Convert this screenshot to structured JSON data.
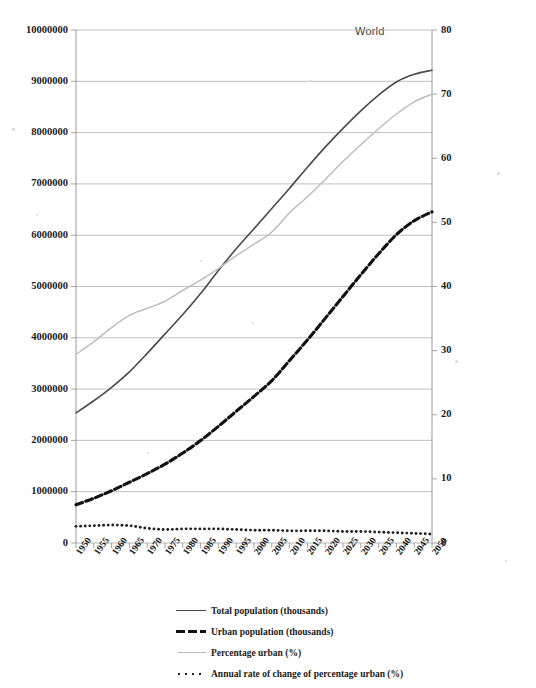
{
  "chart_data": {
    "type": "line",
    "title": "World",
    "xlabel": "",
    "ylabel": "",
    "y2label": "",
    "grid": true,
    "legend_position": "bottom",
    "xlim": [
      1950,
      2050
    ],
    "ylim": [
      0,
      10000000
    ],
    "y2lim": [
      0,
      80
    ],
    "x": [
      1950,
      1955,
      1960,
      1965,
      1970,
      1975,
      1980,
      1985,
      1990,
      1995,
      2000,
      2005,
      2010,
      2015,
      2020,
      2025,
      2030,
      2035,
      2040,
      2045,
      2050
    ],
    "xtick_labels": [
      "1950",
      "1955",
      "1960",
      "1965",
      "1970",
      "1975",
      "1980",
      "1985",
      "1990",
      "1995",
      "2000",
      "2005",
      "2010",
      "2015",
      "2020",
      "2025",
      "2030",
      "2035",
      "2040",
      "2045",
      "2050"
    ],
    "ytick_labels_left": [
      "0",
      "1000000",
      "2000000",
      "3000000",
      "4000000",
      "5000000",
      "6000000",
      "7000000",
      "8000000",
      "9000000",
      "10000000"
    ],
    "ytick_labels_right": [
      "0",
      "10",
      "20",
      "30",
      "40",
      "50",
      "60",
      "70",
      "80"
    ],
    "series": [
      {
        "name": "Total population (thousands)",
        "axis": "left",
        "style": "solid",
        "color": "#4a4a4a",
        "values": [
          2536000,
          2773000,
          3035000,
          3335000,
          3696000,
          4076000,
          4453000,
          4863000,
          5310000,
          5735000,
          6127000,
          6520000,
          6916000,
          7325000,
          7717000,
          8083000,
          8425000,
          8731000,
          8986000,
          9136000,
          9216000
        ]
      },
      {
        "name": "Urban population (thousands)",
        "axis": "left",
        "style": "dashed",
        "color": "#111111",
        "values": [
          745000,
          872000,
          1019000,
          1184000,
          1352000,
          1538000,
          1754000,
          1996000,
          2275000,
          2567000,
          2857000,
          3164000,
          3559000,
          3957000,
          4379000,
          4806000,
          5230000,
          5637000,
          6010000,
          6283000,
          6456000
        ]
      },
      {
        "name": "Percentage urban (%)",
        "axis": "right",
        "style": "solid-light",
        "color": "#bdbdbd",
        "values": [
          29.4,
          31.4,
          33.6,
          35.5,
          36.6,
          37.7,
          39.4,
          41.0,
          42.8,
          44.8,
          46.6,
          48.5,
          51.5,
          54.0,
          56.7,
          59.5,
          62.1,
          64.6,
          66.9,
          68.8,
          70.0
        ]
      },
      {
        "name": "Annual rate of change of percentage urban (%)",
        "axis": "right",
        "style": "dotted",
        "color": "#222222",
        "values": [
          2.6,
          2.7,
          2.8,
          2.7,
          2.3,
          2.1,
          2.2,
          2.2,
          2.2,
          2.1,
          2.0,
          2.0,
          1.9,
          1.9,
          1.9,
          1.8,
          1.8,
          1.7,
          1.6,
          1.5,
          1.4
        ]
      }
    ]
  },
  "legend": {
    "items": [
      {
        "label": "Total population (thousands)"
      },
      {
        "label": "Urban population (thousands)"
      },
      {
        "label": "Percentage urban (%)"
      },
      {
        "label": "Annual rate of change of percentage urban (%)"
      }
    ]
  },
  "colors": {
    "total_population": "#4a4a4a",
    "urban_population": "#111111",
    "percentage_urban": "#bdbdbd",
    "rate_of_change": "#222222",
    "grid": "#b9b9b9",
    "axis": "#9a9a9a"
  }
}
